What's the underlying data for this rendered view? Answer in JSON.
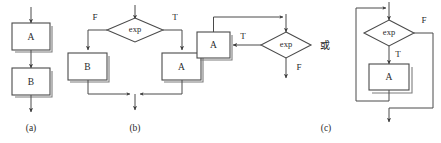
{
  "figure": {
    "background_color": "#ffffff",
    "line_color": "#4a4a4a",
    "text_color": "#2b2b2b"
  },
  "connector": {
    "text": "或"
  },
  "panels": [
    {
      "id": "a",
      "caption": "(a)",
      "kind": "sequence",
      "nodes": [
        {
          "name": "box-a",
          "label": "A",
          "shape": "rectangle"
        },
        {
          "name": "box-b",
          "label": "B",
          "shape": "rectangle"
        }
      ],
      "branch_labels": []
    },
    {
      "id": "b",
      "caption": "(b)",
      "kind": "selection",
      "nodes": [
        {
          "name": "decision-exp",
          "label": "exp",
          "shape": "diamond"
        },
        {
          "name": "box-b",
          "label": "B",
          "shape": "rectangle"
        },
        {
          "name": "box-a",
          "label": "A",
          "shape": "rectangle"
        }
      ],
      "branch_labels": [
        {
          "name": "label-false",
          "text": "F"
        },
        {
          "name": "label-true",
          "text": "T"
        }
      ]
    },
    {
      "id": "c",
      "caption": "(c)",
      "kind": "loop",
      "variants": [
        {
          "name": "loop-variant-left",
          "nodes": [
            {
              "name": "decision-exp",
              "label": "exp",
              "shape": "diamond"
            },
            {
              "name": "box-a",
              "label": "A",
              "shape": "rectangle"
            }
          ],
          "branch_labels": [
            {
              "name": "label-true",
              "text": "T"
            },
            {
              "name": "label-false",
              "text": "F"
            }
          ]
        },
        {
          "name": "loop-variant-right",
          "nodes": [
            {
              "name": "decision-exp",
              "label": "exp",
              "shape": "diamond"
            },
            {
              "name": "box-a",
              "label": "A",
              "shape": "rectangle"
            }
          ],
          "branch_labels": [
            {
              "name": "label-false",
              "text": "F"
            },
            {
              "name": "label-true",
              "text": "T"
            }
          ]
        }
      ]
    }
  ]
}
